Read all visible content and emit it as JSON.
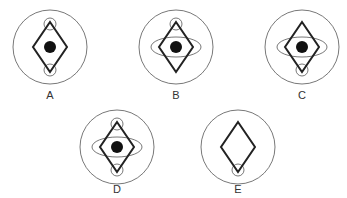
{
  "figures": [
    {
      "label": "A",
      "cx": 50,
      "cy": 47,
      "r": 37,
      "dot": true,
      "ellipse": false,
      "top_circle": true,
      "bottom_circle": true,
      "label_x": 40,
      "label_y": 89
    },
    {
      "label": "B",
      "cx": 176,
      "cy": 47,
      "r": 37,
      "dot": true,
      "ellipse": true,
      "top_circle": true,
      "bottom_circle": false,
      "label_x": 166,
      "label_y": 89
    },
    {
      "label": "C",
      "cx": 302,
      "cy": 47,
      "r": 37,
      "dot": true,
      "ellipse": true,
      "top_circle": false,
      "bottom_circle": true,
      "label_x": 292,
      "label_y": 89
    },
    {
      "label": "D",
      "cx": 117,
      "cy": 147,
      "r": 37,
      "dot": true,
      "ellipse": true,
      "top_circle": true,
      "bottom_circle": true,
      "label_x": 107,
      "label_y": 183
    },
    {
      "label": "E",
      "cx": 238,
      "cy": 147,
      "r": 37,
      "dot": false,
      "ellipse": false,
      "top_circle": false,
      "bottom_circle": true,
      "label_x": 228,
      "label_y": 183
    }
  ],
  "colors": {
    "stroke": "#222222",
    "thin": "#555555",
    "dot": "#111111"
  }
}
